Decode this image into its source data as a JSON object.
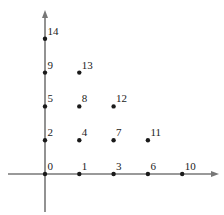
{
  "diagram": {
    "axes": {
      "origin_px": [
        45,
        174
      ],
      "x_axis": {
        "from_px": 8,
        "to_px": 218
      },
      "y_axis": {
        "from_px": 212,
        "to_px": 10
      },
      "color": "#777777"
    },
    "grid_spacing_px": [
      34.3,
      33.8
    ],
    "point_color": "#1a1a1a",
    "points": [
      {
        "i": 0,
        "j": 0,
        "label": "0"
      },
      {
        "i": 1,
        "j": 0,
        "label": "1"
      },
      {
        "i": 0,
        "j": 1,
        "label": "2"
      },
      {
        "i": 2,
        "j": 0,
        "label": "3"
      },
      {
        "i": 1,
        "j": 1,
        "label": "4"
      },
      {
        "i": 0,
        "j": 2,
        "label": "5"
      },
      {
        "i": 3,
        "j": 0,
        "label": "6"
      },
      {
        "i": 2,
        "j": 1,
        "label": "7"
      },
      {
        "i": 1,
        "j": 2,
        "label": "8"
      },
      {
        "i": 0,
        "j": 3,
        "label": "9"
      },
      {
        "i": 4,
        "j": 0,
        "label": "10"
      },
      {
        "i": 3,
        "j": 1,
        "label": "11"
      },
      {
        "i": 2,
        "j": 2,
        "label": "12"
      },
      {
        "i": 1,
        "j": 3,
        "label": "13"
      },
      {
        "i": 0,
        "j": 4,
        "label": "14"
      }
    ]
  }
}
